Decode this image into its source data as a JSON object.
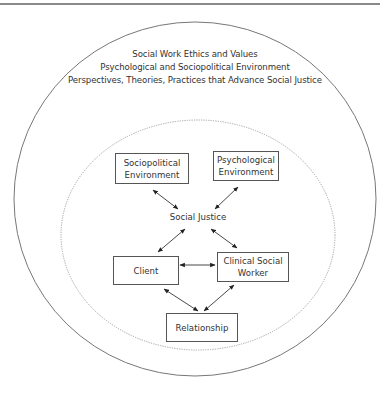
{
  "outer_circle": {
    "lines": [
      "Social Work Ethics and Values",
      "Psychological and Sociopolitical Environment",
      "Perspectives, Theories, Practices that Advance Social Justice"
    ]
  },
  "inner_circle": {
    "center_label": "Social Justice"
  },
  "nodes": {
    "sociopolitical": "Sociopolitical Environment",
    "sociopolitical_l1": "Sociopolitical",
    "sociopolitical_l2": "Environment",
    "psychological_l1": "Psychological",
    "psychological_l2": "Environment",
    "client": "Client",
    "worker_l1": "Clinical Social",
    "worker_l2": "Worker",
    "relationship": "Relationship"
  },
  "edges": [
    {
      "from": "Sociopolitical Environment",
      "to": "Social Justice",
      "type": "bidirectional"
    },
    {
      "from": "Psychological Environment",
      "to": "Social Justice",
      "type": "bidirectional"
    },
    {
      "from": "Social Justice",
      "to": "Client",
      "type": "bidirectional"
    },
    {
      "from": "Social Justice",
      "to": "Clinical Social Worker",
      "type": "bidirectional"
    },
    {
      "from": "Client",
      "to": "Clinical Social Worker",
      "type": "bidirectional"
    },
    {
      "from": "Client",
      "to": "Relationship",
      "type": "bidirectional"
    },
    {
      "from": "Clinical Social Worker",
      "to": "Relationship",
      "type": "bidirectional"
    }
  ],
  "colors": {
    "line": "#555555",
    "text": "#333333"
  }
}
